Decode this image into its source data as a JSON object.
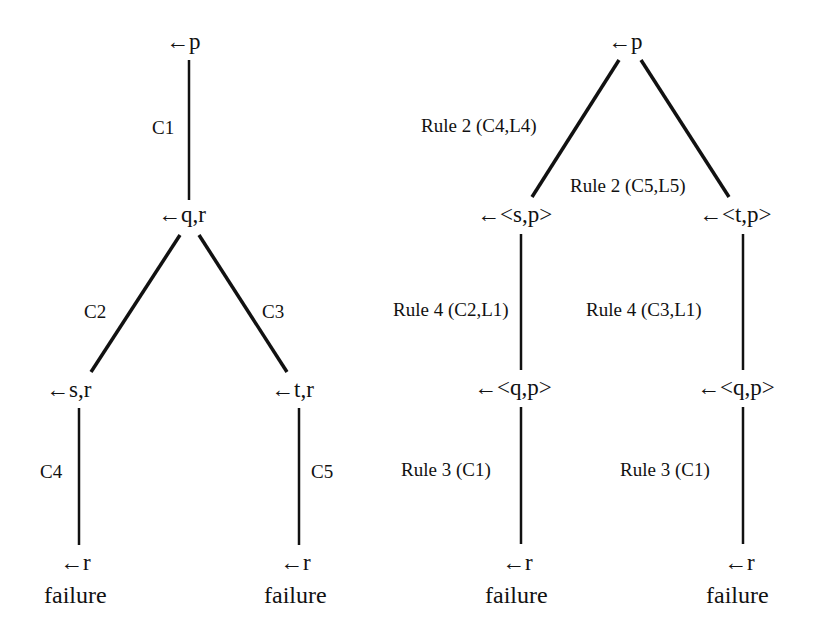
{
  "left_tree": {
    "nodes": {
      "root": "←p",
      "qr": "←q,r",
      "sr": "←s,r",
      "tr": "←t,r",
      "r_left": "←r",
      "r_right": "←r"
    },
    "edge_labels": {
      "root_qr": "C1",
      "qr_sr": "C2",
      "qr_tr": "C3",
      "sr_r": "C4",
      "tr_r": "C5"
    },
    "leaves": [
      "failure",
      "failure"
    ]
  },
  "right_tree": {
    "nodes": {
      "root": "←p",
      "sp": "←<s,p>",
      "tp": "←<t,p>",
      "qp_left": "←<q,p>",
      "qp_right": "←<q,p>",
      "r_left": "←r",
      "r_right": "←r"
    },
    "edge_labels": {
      "root_sp": "Rule 2 (C4,L4)",
      "root_tp": "Rule 2 (C5,L5)",
      "sp_qp": "Rule 4 (C2,L1)",
      "tp_qp": "Rule 4 (C3,L1)",
      "qp_r_left": "Rule 3 (C1)",
      "qp_r_right": "Rule 3 (C1)"
    },
    "leaves": [
      "failure",
      "failure"
    ]
  }
}
